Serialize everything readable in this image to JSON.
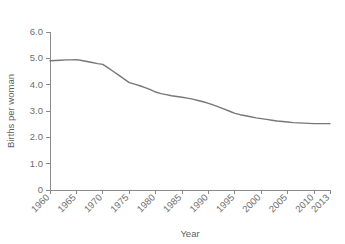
{
  "chart_data": {
    "type": "line",
    "title": "",
    "subtitle": "",
    "xlabel": "Year",
    "ylabel": "Births per woman",
    "xlim": [
      1960,
      2013
    ],
    "ylim": [
      0,
      6.0
    ],
    "grid": false,
    "legend": null,
    "line_color": "#777777",
    "axis_color": "#8a8a8a",
    "text_color": "#6e6e6e",
    "background_color": "#ffffff",
    "yticks": [
      "6.0",
      "5.0",
      "4.0",
      "3.0",
      "2.0",
      "1.0",
      "0"
    ],
    "ytick_values": [
      6.0,
      5.0,
      4.0,
      3.0,
      2.0,
      1.0,
      0
    ],
    "xticks": [
      "1960",
      "1965",
      "1970",
      "1975",
      "1980",
      "1985",
      "1990",
      "1995",
      "2000",
      "2005",
      "2010",
      "2013"
    ],
    "xtick_values": [
      1960,
      1965,
      1970,
      1975,
      1980,
      1985,
      1990,
      1995,
      2000,
      2005,
      2010,
      2013
    ],
    "series": [
      {
        "name": "Births per woman",
        "x": [
          1960,
          1961,
          1962,
          1963,
          1964,
          1965,
          1966,
          1967,
          1968,
          1969,
          1970,
          1971,
          1972,
          1973,
          1974,
          1975,
          1976,
          1977,
          1978,
          1979,
          1980,
          1981,
          1982,
          1983,
          1984,
          1985,
          1986,
          1987,
          1988,
          1989,
          1990,
          1991,
          1992,
          1993,
          1994,
          1995,
          1996,
          1997,
          1998,
          1999,
          2000,
          2001,
          2002,
          2003,
          2004,
          2005,
          2006,
          2007,
          2008,
          2009,
          2010,
          2011,
          2012,
          2013
        ],
        "values": [
          4.91,
          4.92,
          4.93,
          4.94,
          4.94,
          4.95,
          4.92,
          4.88,
          4.84,
          4.8,
          4.77,
          4.64,
          4.5,
          4.36,
          4.22,
          4.08,
          4.02,
          3.96,
          3.89,
          3.81,
          3.72,
          3.66,
          3.62,
          3.58,
          3.55,
          3.52,
          3.49,
          3.45,
          3.4,
          3.35,
          3.29,
          3.22,
          3.15,
          3.07,
          2.99,
          2.91,
          2.86,
          2.82,
          2.78,
          2.74,
          2.71,
          2.68,
          2.65,
          2.62,
          2.6,
          2.58,
          2.56,
          2.55,
          2.54,
          2.53,
          2.52,
          2.52,
          2.52,
          2.52
        ]
      }
    ]
  },
  "axis": {
    "x_title": "Year",
    "y_title": "Births per woman"
  }
}
